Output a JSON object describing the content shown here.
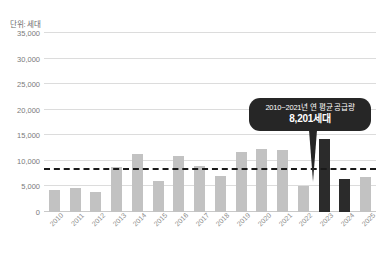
{
  "unit_label": "단위: 세대",
  "callout": {
    "line1": "2010~2021년 연 평균 공급량",
    "line2": "8,201세대"
  },
  "chart_data": {
    "type": "bar",
    "title": "",
    "xlabel": "",
    "ylabel": "단위: 세대",
    "ylim": [
      0,
      35000
    ],
    "grid": true,
    "legend": "none",
    "categories": [
      "2010",
      "2011",
      "2012",
      "2013",
      "2014",
      "2015",
      "2016",
      "2017",
      "2018",
      "2019",
      "2020",
      "2021",
      "2022",
      "2023",
      "2024",
      "2025"
    ],
    "values": [
      4300,
      4600,
      3900,
      8800,
      11400,
      6100,
      11000,
      9000,
      7000,
      11700,
      12300,
      12200,
      5000,
      14300,
      6400,
      6800
    ],
    "ytick_labels": [
      "0",
      "5,000",
      "10,000",
      "15,000",
      "20,000",
      "25,000",
      "30,000",
      "35,000"
    ],
    "ytick_values": [
      0,
      5000,
      10000,
      15000,
      20000,
      25000,
      30000,
      35000
    ],
    "annotations": [
      {
        "type": "hline",
        "value": 8201,
        "label": "2010~2021년 연 평균 공급량 8,201세대",
        "style": "dashed",
        "color": "#1a1a1a"
      }
    ],
    "series_colors": {
      "default": "#c2c2c2",
      "highlight": "#2b2b2b"
    },
    "highlight_categories": [
      "2023",
      "2024"
    ]
  }
}
